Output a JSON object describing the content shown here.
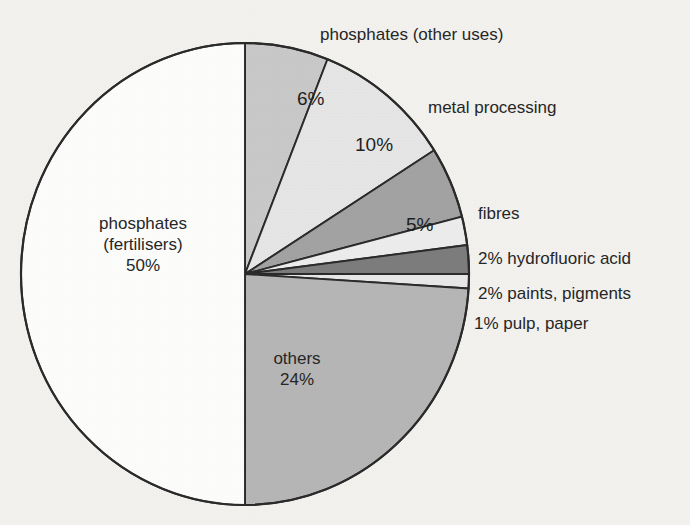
{
  "figure": {
    "background_color": "#f3f2ef",
    "outline_color": "#2b2b2b"
  },
  "chart_data": {
    "type": "pie",
    "title": "",
    "subtitle": "",
    "xlabel": "",
    "ylabel": "",
    "grid": false,
    "legend_position": "none",
    "units": "percent",
    "total": 100,
    "start_angle_deg": 0,
    "direction": "clockwise",
    "categories": [
      "phosphates (other uses)",
      "metal processing",
      "fibres",
      "hydrofluoric acid",
      "paints, pigments",
      "pulp, paper",
      "others",
      "phosphates (fertilisers)"
    ],
    "values": [
      6,
      10,
      5,
      2,
      2,
      1,
      24,
      50
    ],
    "colors": [
      "#c9c9c9",
      "#e6e6e6",
      "#a3a3a3",
      "#ededed",
      "#7d7d7d",
      "#e8e8e8",
      "#b6b6b6",
      "#fdfdfc"
    ],
    "slices": [
      {
        "name": "phosphates (other uses)",
        "value": 6,
        "value_label": "6%",
        "label": "phosphates (other uses)",
        "color": "#c9c9c9",
        "label_placement": "outside-top"
      },
      {
        "name": "metal processing",
        "value": 10,
        "value_label": "10%",
        "label": "metal processing",
        "color": "#e6e6e6",
        "label_placement": "outside-right"
      },
      {
        "name": "fibres",
        "value": 5,
        "value_label": "5%",
        "label": "fibres",
        "color": "#a3a3a3",
        "label_placement": "outside-right"
      },
      {
        "name": "hydrofluoric acid",
        "value": 2,
        "value_label": "2%",
        "label": "2% hydrofluoric acid",
        "color": "#ededed",
        "label_placement": "outside-right"
      },
      {
        "name": "paints, pigments",
        "value": 2,
        "value_label": "2%",
        "label": "2% paints, pigments",
        "color": "#7d7d7d",
        "label_placement": "outside-right"
      },
      {
        "name": "pulp, paper",
        "value": 1,
        "value_label": "1%",
        "label": "1% pulp, paper",
        "color": "#e8e8e8",
        "label_placement": "outside-right"
      },
      {
        "name": "others",
        "value": 24,
        "value_label": "24%",
        "label": "others",
        "color": "#b6b6b6",
        "label_placement": "inside"
      },
      {
        "name": "phosphates (fertilisers)",
        "value": 50,
        "value_label": "50%",
        "label": "phosphates (fertilisers)",
        "color": "#fdfdfc",
        "label_placement": "inside"
      }
    ]
  },
  "labels": {
    "other_uses": "phosphates (other uses)",
    "metal_processing": "metal processing",
    "fibres": "fibres",
    "hydrofluoric_acid": "2% hydrofluoric acid",
    "paints_pigments": "2% paints, pigments",
    "pulp_paper": "1% pulp, paper",
    "fertilisers_line1": "phosphates",
    "fertilisers_line2": "(fertilisers)",
    "fertilisers_line3": "50%",
    "others_line1": "others",
    "others_line2": "24%"
  },
  "values": {
    "other_uses_pct": "6%",
    "metal_processing_pct": "10%",
    "fibres_pct": "5%"
  }
}
